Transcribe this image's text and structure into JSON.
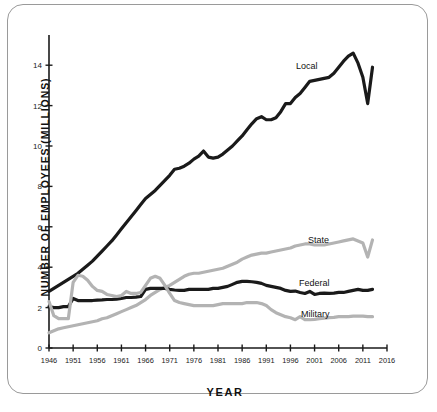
{
  "figure": {
    "y_axis_title": "NUMBER OF EMPLOYEES (MILLIONS)",
    "x_axis_title": "YEAR"
  },
  "labels": {
    "local": "Local",
    "state": "State",
    "federal": "Federal",
    "military": "Military"
  },
  "colors": {
    "dark_series": "#1a1a1a",
    "light_series": "#b3b3b3",
    "axis": "#1a1a1a",
    "card_border": "#9a9a9a"
  },
  "chart_data": {
    "type": "line",
    "title": "",
    "xlabel": "YEAR",
    "ylabel": "NUMBER OF EMPLOYEES (MILLIONS)",
    "xlim": [
      1946,
      2016
    ],
    "ylim": [
      0,
      15
    ],
    "xticks": [
      1946,
      1951,
      1956,
      1961,
      1966,
      1971,
      1976,
      1981,
      1986,
      1991,
      1996,
      2001,
      2006,
      2011,
      2016
    ],
    "yticks": [
      0,
      2,
      4,
      6,
      8,
      10,
      12,
      14
    ],
    "grid": false,
    "legend": "inline-labels",
    "series": [
      {
        "name": "Local",
        "color": "#1a1a1a",
        "x": [
          1946,
          1947,
          1948,
          1949,
          1950,
          1951,
          1952,
          1953,
          1954,
          1955,
          1956,
          1957,
          1958,
          1959,
          1960,
          1961,
          1962,
          1963,
          1964,
          1965,
          1966,
          1967,
          1968,
          1969,
          1970,
          1971,
          1972,
          1973,
          1974,
          1975,
          1976,
          1977,
          1978,
          1979,
          1980,
          1981,
          1982,
          1983,
          1984,
          1985,
          1986,
          1987,
          1988,
          1989,
          1990,
          1991,
          1992,
          1993,
          1994,
          1995,
          1996,
          1997,
          1998,
          1999,
          2000,
          2001,
          2002,
          2003,
          2004,
          2005,
          2006,
          2007,
          2008,
          2009,
          2010,
          2011,
          2012,
          2013
        ],
        "y": [
          2.8,
          2.95,
          3.1,
          3.25,
          3.4,
          3.55,
          3.7,
          3.9,
          4.1,
          4.3,
          4.55,
          4.8,
          5.05,
          5.3,
          5.6,
          5.9,
          6.2,
          6.5,
          6.8,
          7.1,
          7.4,
          7.6,
          7.8,
          8.05,
          8.3,
          8.55,
          8.85,
          8.9,
          9.0,
          9.15,
          9.35,
          9.5,
          9.75,
          9.45,
          9.4,
          9.45,
          9.6,
          9.8,
          10.0,
          10.25,
          10.5,
          10.8,
          11.1,
          11.35,
          11.45,
          11.3,
          11.3,
          11.4,
          11.7,
          12.1,
          12.1,
          12.4,
          12.6,
          12.9,
          13.2,
          13.25,
          13.3,
          13.35,
          13.4,
          13.6,
          13.9,
          14.2,
          14.45,
          14.6,
          14.1,
          13.4,
          12.1,
          13.9
        ]
      },
      {
        "name": "State",
        "color": "#b3b3b3",
        "x": [
          1946,
          1947,
          1948,
          1949,
          1950,
          1951,
          1952,
          1953,
          1954,
          1955,
          1956,
          1957,
          1958,
          1959,
          1960,
          1961,
          1962,
          1963,
          1964,
          1965,
          1966,
          1967,
          1968,
          1969,
          1970,
          1971,
          1972,
          1973,
          1974,
          1975,
          1976,
          1977,
          1978,
          1979,
          1980,
          1981,
          1982,
          1983,
          1984,
          1985,
          1986,
          1987,
          1988,
          1989,
          1990,
          1991,
          1992,
          1993,
          1994,
          1995,
          1996,
          1997,
          1998,
          1999,
          2000,
          2001,
          2002,
          2003,
          2004,
          2005,
          2006,
          2007,
          2008,
          2009,
          2010,
          2011,
          2012,
          2013
        ],
        "y": [
          0.75,
          0.85,
          0.95,
          1.0,
          1.05,
          1.1,
          1.15,
          1.2,
          1.25,
          1.3,
          1.35,
          1.45,
          1.5,
          1.6,
          1.7,
          1.8,
          1.9,
          2.0,
          2.1,
          2.25,
          2.4,
          2.6,
          2.75,
          2.9,
          3.0,
          3.1,
          3.25,
          3.4,
          3.55,
          3.65,
          3.7,
          3.7,
          3.75,
          3.8,
          3.85,
          3.9,
          3.95,
          4.05,
          4.15,
          4.25,
          4.4,
          4.5,
          4.6,
          4.65,
          4.7,
          4.7,
          4.75,
          4.8,
          4.85,
          4.9,
          4.95,
          5.05,
          5.1,
          5.15,
          5.15,
          5.1,
          5.1,
          5.1,
          5.15,
          5.2,
          5.25,
          5.3,
          5.35,
          5.4,
          5.3,
          5.2,
          4.5,
          5.35
        ]
      },
      {
        "name": "Federal",
        "color": "#1a1a1a",
        "x": [
          1946,
          1947,
          1948,
          1949,
          1950,
          1951,
          1952,
          1953,
          1954,
          1955,
          1956,
          1957,
          1958,
          1959,
          1960,
          1961,
          1962,
          1963,
          1964,
          1965,
          1966,
          1967,
          1968,
          1969,
          1970,
          1971,
          1972,
          1973,
          1974,
          1975,
          1976,
          1977,
          1978,
          1979,
          1980,
          1981,
          1982,
          1983,
          1984,
          1985,
          1986,
          1987,
          1988,
          1989,
          1990,
          1991,
          1992,
          1993,
          1994,
          1995,
          1996,
          1997,
          1998,
          1999,
          2000,
          2001,
          2002,
          2003,
          2004,
          2005,
          2006,
          2007,
          2008,
          2009,
          2010,
          2011,
          2012,
          2013
        ],
        "y": [
          2.05,
          2.0,
          2.0,
          2.05,
          2.05,
          2.45,
          2.35,
          2.35,
          2.35,
          2.35,
          2.37,
          2.38,
          2.4,
          2.4,
          2.42,
          2.45,
          2.5,
          2.5,
          2.52,
          2.55,
          2.9,
          2.95,
          2.95,
          2.95,
          2.95,
          2.9,
          2.87,
          2.85,
          2.85,
          2.9,
          2.9,
          2.9,
          2.9,
          2.9,
          2.95,
          2.95,
          3.0,
          3.05,
          3.15,
          3.25,
          3.3,
          3.3,
          3.28,
          3.25,
          3.2,
          3.1,
          3.05,
          3.0,
          2.95,
          2.85,
          2.8,
          2.82,
          2.75,
          2.7,
          2.8,
          2.65,
          2.7,
          2.72,
          2.7,
          2.72,
          2.75,
          2.75,
          2.8,
          2.85,
          2.9,
          2.85,
          2.85,
          2.9
        ]
      },
      {
        "name": "Military",
        "color": "#b3b3b3",
        "x": [
          1946,
          1947,
          1948,
          1949,
          1950,
          1951,
          1952,
          1953,
          1954,
          1955,
          1956,
          1957,
          1958,
          1959,
          1960,
          1961,
          1962,
          1963,
          1964,
          1965,
          1966,
          1967,
          1968,
          1969,
          1970,
          1971,
          1972,
          1973,
          1974,
          1975,
          1976,
          1977,
          1978,
          1979,
          1980,
          1981,
          1982,
          1983,
          1984,
          1985,
          1986,
          1987,
          1988,
          1989,
          1990,
          1991,
          1992,
          1993,
          1994,
          1995,
          1996,
          1997,
          1998,
          1999,
          2000,
          2001,
          2002,
          2003,
          2004,
          2005,
          2006,
          2007,
          2008,
          2009,
          2010,
          2011,
          2012,
          2013
        ],
        "y": [
          2.3,
          1.6,
          1.45,
          1.45,
          1.45,
          3.25,
          3.6,
          3.55,
          3.35,
          3.05,
          2.85,
          2.8,
          2.65,
          2.6,
          2.55,
          2.6,
          2.8,
          2.7,
          2.7,
          2.75,
          3.1,
          3.45,
          3.55,
          3.45,
          3.1,
          2.7,
          2.35,
          2.25,
          2.2,
          2.15,
          2.1,
          2.1,
          2.1,
          2.1,
          2.1,
          2.15,
          2.2,
          2.2,
          2.2,
          2.2,
          2.2,
          2.25,
          2.25,
          2.25,
          2.2,
          2.1,
          1.9,
          1.75,
          1.65,
          1.55,
          1.5,
          1.4,
          1.55,
          1.4,
          1.4,
          1.42,
          1.45,
          1.48,
          1.5,
          1.52,
          1.55,
          1.55,
          1.55,
          1.58,
          1.58,
          1.58,
          1.55,
          1.55
        ]
      }
    ]
  }
}
